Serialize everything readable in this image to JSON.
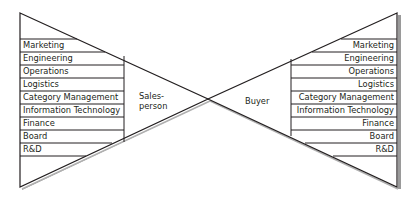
{
  "diagram": {
    "type": "bow-tie relationship model",
    "left": {
      "role_line1": "Sales-",
      "role_line2": "person",
      "functions": [
        "Marketing",
        "Engineering",
        "Operations",
        "Logistics",
        "Category Management",
        "Information Technology",
        "Finance",
        "Board",
        "R&D"
      ]
    },
    "right": {
      "role": "Buyer",
      "functions": [
        "Marketing",
        "Engineering",
        "Operations",
        "Logistics",
        "Category Management",
        "Information Technology",
        "Finance",
        "Board",
        "R&D"
      ]
    },
    "colors": {
      "line": "#231f20",
      "shadow": "#9a9a9a",
      "background": "#ffffff"
    }
  }
}
